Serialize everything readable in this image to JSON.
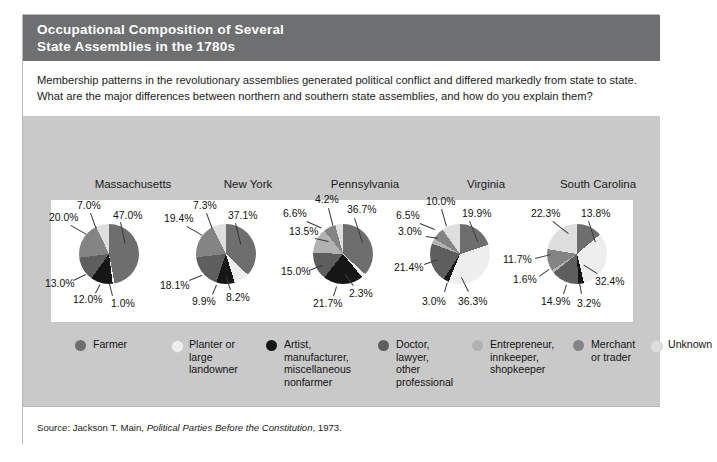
{
  "figure": {
    "title_line1": "Occupational Composition of Several",
    "title_line2": "State Assemblies in the 1780s",
    "title_bg": "#6d6f71",
    "backdrop_bg": "#c9c9c9",
    "intro_line1": "Membership patterns in the revolutionary assemblies generated political conflict and differed markedly from state to state.",
    "intro_line2": "What are the major differences between northern and southern state assemblies, and how do you explain them?",
    "source": "Source: Jackson T. Main, ",
    "source_italic": "Political Parties Before the Constitution",
    "source_tail": ", 1973."
  },
  "legend": {
    "items": [
      {
        "label": "Farmer",
        "color": "#6e6e6e"
      },
      {
        "label": "Planter or\nlarge\nlandowner",
        "color": "#eeeeee"
      },
      {
        "label": "Artist,\nmanufacturer,\nmiscellaneous\nnonfarmer",
        "color": "#161616"
      },
      {
        "label": "Doctor,\nlawyer,\nother\nprofessional",
        "color": "#5e5e5e"
      },
      {
        "label": "Entrepreneur,\ninnkeeper,\nshopkeeper",
        "color": "#b2b2b2"
      },
      {
        "label": "Merchant\nor trader",
        "color": "#848484"
      },
      {
        "label": "Unknown",
        "color": "#dedede"
      }
    ]
  },
  "chart_data": {
    "type": "pie",
    "title": "Occupational Composition of Several State Assemblies in the 1780s",
    "legend_position": "bottom",
    "categories": [
      "Farmer",
      "Planter or large landowner",
      "Artist, manufacturer, miscellaneous nonfarmer",
      "Doctor, lawyer, other professional",
      "Entrepreneur, innkeeper, shopkeeper",
      "Merchant or trader",
      "Unknown"
    ],
    "category_colors": [
      "#6e6e6e",
      "#eeeeee",
      "#161616",
      "#5e5e5e",
      "#b2b2b2",
      "#848484",
      "#dedede"
    ],
    "charts": [
      {
        "name": "Massachusetts",
        "slices": [
          {
            "category": "Farmer",
            "value": 47.0,
            "label": "47.0%"
          },
          {
            "category": "Planter or large landowner",
            "value": 1.0,
            "label": "1.0%"
          },
          {
            "category": "Artist, manufacturer, miscellaneous nonfarmer",
            "value": 12.0,
            "label": "12.0%"
          },
          {
            "category": "Doctor, lawyer, other professional",
            "value": 13.0,
            "label": "13.0%"
          },
          {
            "category": "Merchant or trader",
            "value": 20.0,
            "label": "20.0%"
          },
          {
            "category": "Unknown",
            "value": 7.0,
            "label": "7.0%"
          }
        ]
      },
      {
        "name": "New York",
        "slices": [
          {
            "category": "Farmer",
            "value": 37.1,
            "label": "37.1%"
          },
          {
            "category": "Planter or large landowner",
            "value": 8.2,
            "label": "8.2%"
          },
          {
            "category": "Artist, manufacturer, miscellaneous nonfarmer",
            "value": 9.9,
            "label": "9.9%"
          },
          {
            "category": "Doctor, lawyer, other professional",
            "value": 18.1,
            "label": "18.1%"
          },
          {
            "category": "Merchant or trader",
            "value": 19.4,
            "label": "19.4%"
          },
          {
            "category": "Unknown",
            "value": 7.3,
            "label": "7.3%"
          }
        ]
      },
      {
        "name": "Pennsylvania",
        "slices": [
          {
            "category": "Farmer",
            "value": 36.7,
            "label": "36.7%"
          },
          {
            "category": "Planter or large landowner",
            "value": 2.3,
            "label": "2.3%"
          },
          {
            "category": "Artist, manufacturer, miscellaneous nonfarmer",
            "value": 21.7,
            "label": "21.7%"
          },
          {
            "category": "Doctor, lawyer, other professional",
            "value": 15.0,
            "label": "15.0%"
          },
          {
            "category": "Entrepreneur, innkeeper, shopkeeper",
            "value": 13.5,
            "label": "13.5%"
          },
          {
            "category": "Merchant or trader",
            "value": 6.6,
            "label": "6.6%"
          },
          {
            "category": "Unknown",
            "value": 4.2,
            "label": "4.2%"
          }
        ]
      },
      {
        "name": "Virginia",
        "slices": [
          {
            "category": "Farmer",
            "value": 19.9,
            "label": "19.9%"
          },
          {
            "category": "Planter or large landowner",
            "value": 36.3,
            "label": "36.3%"
          },
          {
            "category": "Artist, manufacturer, miscellaneous nonfarmer",
            "value": 3.0,
            "label": "3.0%"
          },
          {
            "category": "Doctor, lawyer, other professional",
            "value": 21.4,
            "label": "21.4%"
          },
          {
            "category": "Entrepreneur, innkeeper, shopkeeper",
            "value": 3.0,
            "label": "3.0%"
          },
          {
            "category": "Merchant or trader",
            "value": 6.5,
            "label": "6.5%"
          },
          {
            "category": "Unknown",
            "value": 10.0,
            "label": "10.0%"
          }
        ]
      },
      {
        "name": "South Carolina",
        "slices": [
          {
            "category": "Farmer",
            "value": 13.8,
            "label": "13.8%"
          },
          {
            "category": "Planter or large landowner",
            "value": 32.4,
            "label": "32.4%"
          },
          {
            "category": "Artist, manufacturer, miscellaneous nonfarmer",
            "value": 3.2,
            "label": "3.2%"
          },
          {
            "category": "Doctor, lawyer, other professional",
            "value": 14.9,
            "label": "14.9%"
          },
          {
            "category": "Entrepreneur, innkeeper, shopkeeper",
            "value": 1.6,
            "label": "1.6%"
          },
          {
            "category": "Merchant or trader",
            "value": 11.7,
            "label": "11.7%"
          },
          {
            "category": "Unknown",
            "value": 22.3,
            "label": "22.3%"
          }
        ]
      }
    ]
  },
  "layout": {
    "pie_units": [
      {
        "left": 0,
        "name_left": 40,
        "name_width": 140
      },
      {
        "left": 117,
        "name_left": 160,
        "name_width": 130
      },
      {
        "left": 234,
        "name_left": 272,
        "name_width": 140
      },
      {
        "left": 351,
        "name_left": 398,
        "name_width": 130
      },
      {
        "left": 468,
        "name_left": 500,
        "name_width": 150
      }
    ],
    "label_positions": [
      [
        {
          "t": "47.0%",
          "x": 62,
          "y": 10,
          "lx": 70,
          "ly": 22,
          "len": 22,
          "rot": 78
        },
        {
          "t": "7.0%",
          "x": 26,
          "y": 0,
          "lx": 40,
          "ly": 13,
          "len": 16,
          "rot": 70
        },
        {
          "t": "20.0%",
          "x": -2,
          "y": 12,
          "lx": 20,
          "ly": 25,
          "len": 18,
          "rot": 30
        },
        {
          "t": "13.0%",
          "x": -6,
          "y": 78,
          "lx": 22,
          "ly": 80,
          "len": 14,
          "rot": -25
        },
        {
          "t": "12.0%",
          "x": 22,
          "y": 94,
          "lx": 44,
          "ly": 93,
          "len": 10,
          "rot": -62
        },
        {
          "t": "1.0%",
          "x": 60,
          "y": 98,
          "lx": 61,
          "ly": 96,
          "len": 13,
          "rot": -104
        }
      ],
      [
        {
          "t": "37.1%",
          "x": 60,
          "y": 10,
          "lx": 68,
          "ly": 23,
          "len": 22,
          "rot": 76
        },
        {
          "t": "7.3%",
          "x": 25,
          "y": 0,
          "lx": 39,
          "ly": 13,
          "len": 16,
          "rot": 70
        },
        {
          "t": "19.4%",
          "x": -4,
          "y": 13,
          "lx": 19,
          "ly": 26,
          "len": 18,
          "rot": 30
        },
        {
          "t": "18.1%",
          "x": -8,
          "y": 80,
          "lx": 21,
          "ly": 80,
          "len": 14,
          "rot": -22
        },
        {
          "t": "9.9%",
          "x": 24,
          "y": 96,
          "lx": 44,
          "ly": 94,
          "len": 10,
          "rot": -66
        },
        {
          "t": "8.2%",
          "x": 58,
          "y": 92,
          "lx": 62,
          "ly": 90,
          "len": 14,
          "rot": -108
        }
      ],
      [
        {
          "t": "36.7%",
          "x": 62,
          "y": 4,
          "lx": 70,
          "ly": 18,
          "len": 26,
          "rot": 72
        },
        {
          "t": "4.2%",
          "x": 30,
          "y": -6,
          "lx": 44,
          "ly": 8,
          "len": 18,
          "rot": 76
        },
        {
          "t": "6.6%",
          "x": -2,
          "y": 8,
          "lx": 22,
          "ly": 21,
          "len": 16,
          "rot": 24
        },
        {
          "t": "13.5%",
          "x": 4,
          "y": 26,
          "lx": 30,
          "ly": 38,
          "len": 14,
          "rot": 12
        },
        {
          "t": "15.0%",
          "x": -4,
          "y": 66,
          "lx": 24,
          "ly": 70,
          "len": 14,
          "rot": -22
        },
        {
          "t": "21.7%",
          "x": 28,
          "y": 98,
          "lx": 48,
          "ly": 96,
          "len": 10,
          "rot": -72
        },
        {
          "t": "2.3%",
          "x": 64,
          "y": 88,
          "lx": 68,
          "ly": 86,
          "len": 14,
          "rot": -126
        }
      ],
      [
        {
          "t": "19.9%",
          "x": 60,
          "y": 8,
          "lx": 68,
          "ly": 21,
          "len": 22,
          "rot": 68
        },
        {
          "t": "10.0%",
          "x": 24,
          "y": -4,
          "lx": 40,
          "ly": 9,
          "len": 18,
          "rot": 74
        },
        {
          "t": "6.5%",
          "x": -6,
          "y": 10,
          "lx": 18,
          "ly": 23,
          "len": 16,
          "rot": 22
        },
        {
          "t": "3.0%",
          "x": -4,
          "y": 26,
          "lx": 24,
          "ly": 36,
          "len": 12,
          "rot": 8
        },
        {
          "t": "21.4%",
          "x": -8,
          "y": 62,
          "lx": 22,
          "ly": 64,
          "len": 14,
          "rot": -20
        },
        {
          "t": "3.0%",
          "x": 20,
          "y": 96,
          "lx": 42,
          "ly": 92,
          "len": 10,
          "rot": -74
        },
        {
          "t": "36.3%",
          "x": 56,
          "y": 96,
          "lx": 66,
          "ly": 92,
          "len": 16,
          "rot": -116
        }
      ],
      [
        {
          "t": "13.8%",
          "x": 62,
          "y": 8,
          "lx": 70,
          "ly": 21,
          "len": 22,
          "rot": 72
        },
        {
          "t": "22.3%",
          "x": 12,
          "y": 8,
          "lx": 34,
          "ly": 21,
          "len": 20,
          "rot": 38
        },
        {
          "t": "11.7%",
          "x": -16,
          "y": 54,
          "lx": 16,
          "ly": 58,
          "len": 16,
          "rot": -14
        },
        {
          "t": "1.6%",
          "x": -6,
          "y": 74,
          "lx": 20,
          "ly": 76,
          "len": 12,
          "rot": -36
        },
        {
          "t": "14.9%",
          "x": 22,
          "y": 96,
          "lx": 44,
          "ly": 94,
          "len": 10,
          "rot": -72
        },
        {
          "t": "3.2%",
          "x": 58,
          "y": 98,
          "lx": 62,
          "ly": 94,
          "len": 12,
          "rot": -100
        },
        {
          "t": "32.4%",
          "x": 76,
          "y": 76,
          "lx": 78,
          "ly": 74,
          "len": 16,
          "rot": -148
        }
      ]
    ],
    "legend_positions": [
      {
        "left": 52,
        "width": 95
      },
      {
        "left": 148,
        "width": 95
      },
      {
        "left": 243,
        "width": 110
      },
      {
        "left": 355,
        "width": 92
      },
      {
        "left": 449,
        "width": 100
      },
      {
        "left": 550,
        "width": 72
      },
      {
        "left": 627,
        "width": 78
      }
    ]
  }
}
